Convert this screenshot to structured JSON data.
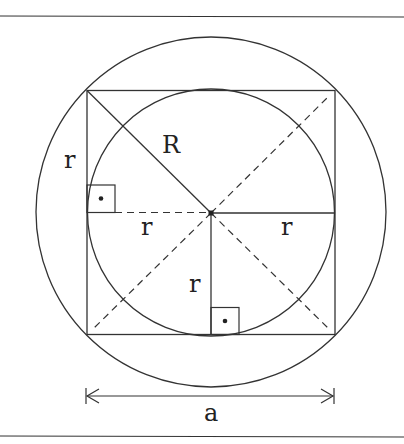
{
  "diagram": {
    "stroke_color": "#333333",
    "labels": {
      "R": "R",
      "r_left": "r",
      "r_center_left": "r",
      "r_center_right": "r",
      "r_vertical": "r",
      "a": "a"
    },
    "geometry": {
      "center": [
        211,
        213
      ],
      "outer_circle_radius": 175,
      "inner_circle_radius": 124,
      "square": {
        "left": 87,
        "top": 90,
        "right": 335,
        "bottom": 335
      },
      "dimension_arrow": {
        "y": 396,
        "x1": 86,
        "x2": 334
      }
    },
    "right_angle_markers": 2
  }
}
